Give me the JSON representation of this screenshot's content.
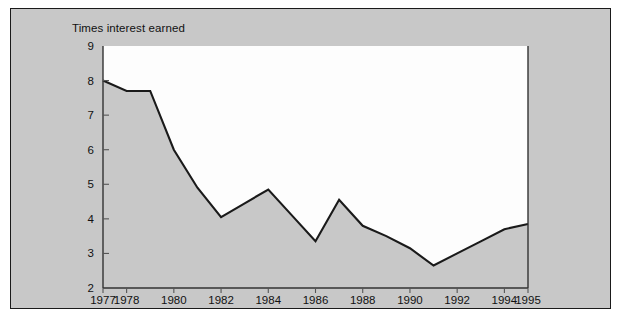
{
  "figure": {
    "background_color": "#ffffff",
    "panel_fill": "#c8c8c8",
    "panel_border_color": "#1a1a1a",
    "plot_background": "#fdfdfd"
  },
  "chart_data": {
    "type": "area",
    "title": "Times interest earned",
    "subtitle": "",
    "xlabel": "",
    "ylabel": "Times interest earned",
    "x": [
      1977,
      1978,
      1979,
      1980,
      1981,
      1982,
      1983,
      1984,
      1985,
      1986,
      1987,
      1988,
      1989,
      1990,
      1991,
      1992,
      1993,
      1994,
      1995
    ],
    "values": [
      8.0,
      7.7,
      7.7,
      6.0,
      4.9,
      4.05,
      4.45,
      4.85,
      4.1,
      3.35,
      4.55,
      3.8,
      3.5,
      3.15,
      2.65,
      3.0,
      3.35,
      3.7,
      3.85
    ],
    "series": [
      {
        "name": "Times interest earned",
        "values": [
          8.0,
          7.7,
          7.7,
          6.0,
          4.9,
          4.05,
          4.45,
          4.85,
          4.1,
          3.35,
          4.55,
          3.8,
          3.5,
          3.15,
          2.65,
          3.0,
          3.35,
          3.7,
          3.85
        ],
        "line_color": "#1a1a1a",
        "fill_color": "#c8c8c8"
      }
    ],
    "xlim": [
      1977,
      1995
    ],
    "ylim": [
      2,
      9
    ],
    "ytick_labels": [
      "9",
      "8",
      "7",
      "6",
      "5",
      "4",
      "3",
      "2"
    ],
    "ytick_values": [
      9,
      8,
      7,
      6,
      5,
      4,
      3,
      2
    ],
    "xtick_labels": [
      "1977",
      "1978",
      "1980",
      "1982",
      "1984",
      "1986",
      "1988",
      "1990",
      "1992",
      "1994",
      "1995"
    ],
    "xtick_values": [
      1977,
      1978,
      1980,
      1982,
      1984,
      1986,
      1988,
      1990,
      1992,
      1994,
      1995
    ],
    "grid": false,
    "legend": null,
    "legend_position": "none",
    "annotations": []
  }
}
